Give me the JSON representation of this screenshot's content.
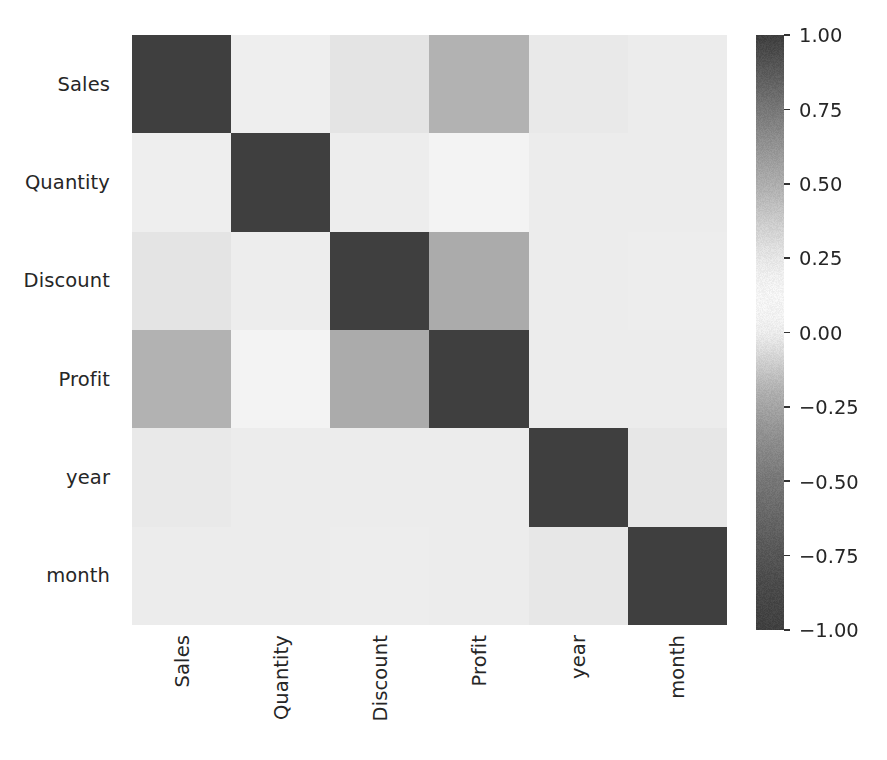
{
  "chart_data": {
    "type": "heatmap",
    "title": "",
    "xlabel": "",
    "ylabel": "",
    "categories": [
      "Sales",
      "Quantity",
      "Discount",
      "Profit",
      "year",
      "month"
    ],
    "x_tick_labels": [
      "Sales",
      "Quantity",
      "Discount",
      "Profit",
      "year",
      "month"
    ],
    "y_tick_labels": [
      "Sales",
      "Quantity",
      "Discount",
      "Profit",
      "year",
      "month"
    ],
    "colormap": "gray-diverging",
    "vmin": -1.0,
    "vmax": 1.0,
    "colorbar": {
      "position": "right",
      "orientation": "vertical",
      "ticks": [
        1.0,
        0.75,
        0.5,
        0.25,
        0.0,
        -0.25,
        -0.5,
        -0.75,
        -1.0
      ],
      "tick_labels": [
        "1.00",
        "0.75",
        "0.50",
        "0.25",
        "0.00",
        "−0.25",
        "−0.50",
        "−0.75",
        "−1.00"
      ]
    },
    "grid": false,
    "annotations": false,
    "matrix": [
      [
        1.0,
        0.2,
        -0.03,
        0.48,
        -0.01,
        0.0
      ],
      [
        0.2,
        1.0,
        0.01,
        0.11,
        0.0,
        0.0
      ],
      [
        -0.03,
        0.01,
        1.0,
        -0.22,
        0.0,
        0.01
      ],
      [
        0.48,
        0.11,
        -0.22,
        1.0,
        0.0,
        0.0
      ],
      [
        -0.01,
        0.0,
        0.0,
        0.0,
        1.0,
        -0.02
      ],
      [
        0.0,
        0.0,
        0.01,
        0.0,
        -0.02,
        1.0
      ]
    ],
    "rows": [
      {
        "label": "Sales",
        "values": [
          1.0,
          0.2,
          -0.03,
          0.48,
          -0.01,
          0.0
        ]
      },
      {
        "label": "Quantity",
        "values": [
          0.2,
          1.0,
          0.01,
          0.11,
          0.0,
          0.0
        ]
      },
      {
        "label": "Discount",
        "values": [
          -0.03,
          0.01,
          1.0,
          -0.22,
          0.0,
          0.01
        ]
      },
      {
        "label": "Profit",
        "values": [
          0.48,
          0.11,
          -0.22,
          1.0,
          0.0,
          0.0
        ]
      },
      {
        "label": "year",
        "values": [
          -0.01,
          0.0,
          0.0,
          0.0,
          1.0,
          -0.02
        ]
      },
      {
        "label": "month",
        "values": [
          0.0,
          0.0,
          0.01,
          0.0,
          -0.02,
          1.0
        ]
      }
    ]
  },
  "colors": {
    "background": "#ffffff",
    "text": "#262626",
    "tick_mark": "#333333",
    "extreme_dark": "#3d3d3d",
    "mid_light": "#ececec"
  }
}
